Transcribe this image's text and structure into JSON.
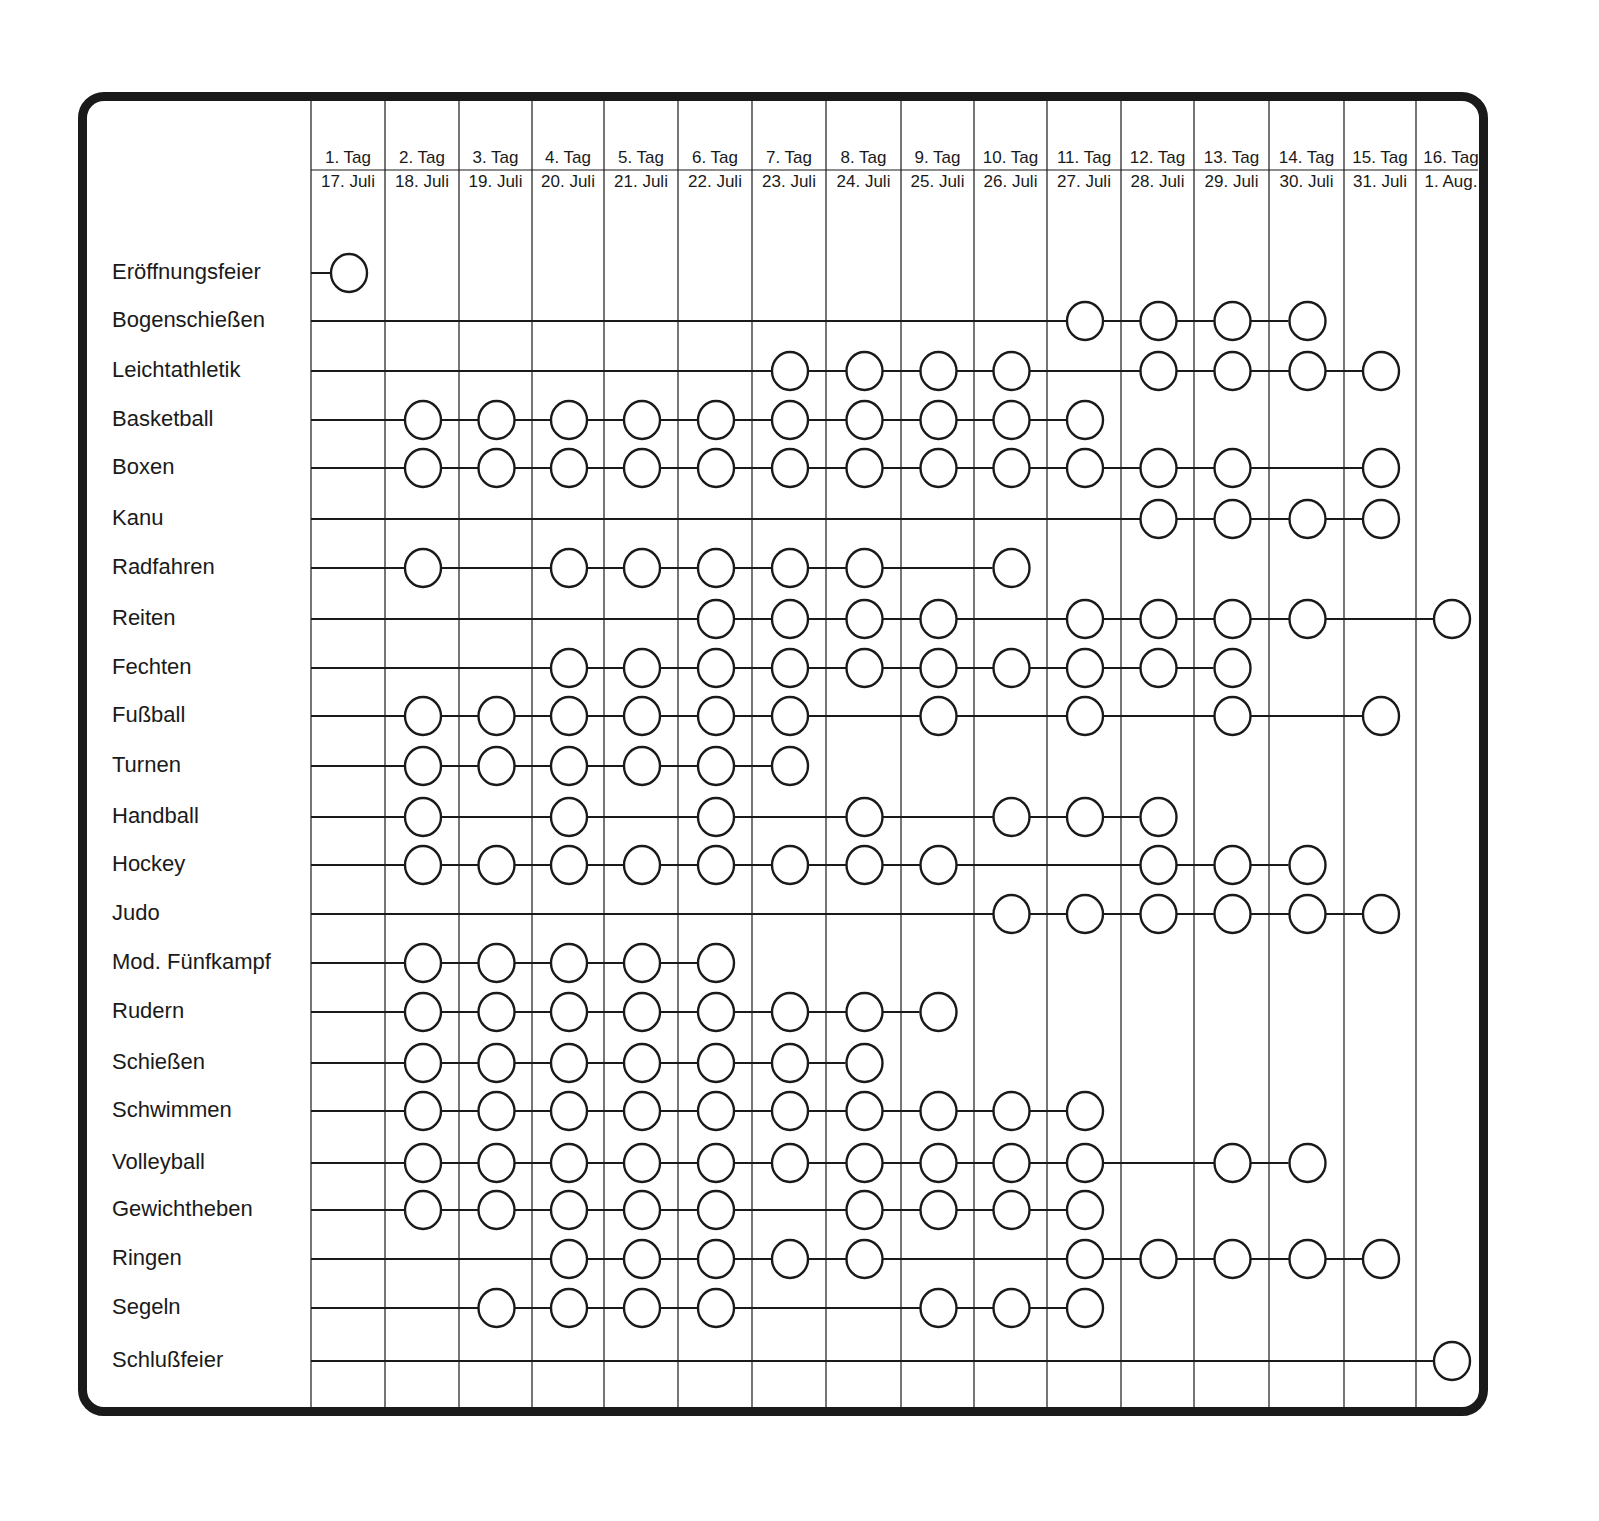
{
  "chart_data": {
    "type": "table",
    "title": "",
    "columns": [
      {
        "day": "1. Tag",
        "date": "17. Juli"
      },
      {
        "day": "2. Tag",
        "date": "18. Juli"
      },
      {
        "day": "3. Tag",
        "date": "19. Juli"
      },
      {
        "day": "4. Tag",
        "date": "20. Juli"
      },
      {
        "day": "5. Tag",
        "date": "21. Juli"
      },
      {
        "day": "6. Tag",
        "date": "22. Juli"
      },
      {
        "day": "7. Tag",
        "date": "23. Juli"
      },
      {
        "day": "8. Tag",
        "date": "24. Juli"
      },
      {
        "day": "9. Tag",
        "date": "25. Juli"
      },
      {
        "day": "10. Tag",
        "date": "26. Juli"
      },
      {
        "day": "11. Tag",
        "date": "27. Juli"
      },
      {
        "day": "12. Tag",
        "date": "28. Juli"
      },
      {
        "day": "13. Tag",
        "date": "29. Juli"
      },
      {
        "day": "14. Tag",
        "date": "30. Juli"
      },
      {
        "day": "15. Tag",
        "date": "31. Juli"
      },
      {
        "day": "16. Tag",
        "date": "1. Aug."
      }
    ],
    "rows": [
      {
        "sport": "Eröffnungsfeier",
        "days": [
          1
        ]
      },
      {
        "sport": "Bogenschießen",
        "days": [
          11,
          12,
          13,
          14
        ]
      },
      {
        "sport": "Leichtathletik",
        "days": [
          7,
          8,
          9,
          10,
          12,
          13,
          14,
          15
        ]
      },
      {
        "sport": "Basketball",
        "days": [
          2,
          3,
          4,
          5,
          6,
          7,
          8,
          9,
          10,
          11
        ]
      },
      {
        "sport": "Boxen",
        "days": [
          2,
          3,
          4,
          5,
          6,
          7,
          8,
          9,
          10,
          11,
          12,
          13,
          15
        ]
      },
      {
        "sport": "Kanu",
        "days": [
          12,
          13,
          14,
          15
        ]
      },
      {
        "sport": "Radfahren",
        "days": [
          2,
          4,
          5,
          6,
          7,
          8,
          10
        ]
      },
      {
        "sport": "Reiten",
        "days": [
          6,
          7,
          8,
          9,
          11,
          12,
          13,
          14,
          16
        ]
      },
      {
        "sport": "Fechten",
        "days": [
          4,
          5,
          6,
          7,
          8,
          9,
          10,
          11,
          12,
          13
        ]
      },
      {
        "sport": "Fußball",
        "days": [
          2,
          3,
          4,
          5,
          6,
          7,
          9,
          11,
          13,
          15
        ]
      },
      {
        "sport": "Turnen",
        "days": [
          2,
          3,
          4,
          5,
          6,
          7
        ]
      },
      {
        "sport": "Handball",
        "days": [
          2,
          4,
          6,
          8,
          10,
          11,
          12
        ]
      },
      {
        "sport": "Hockey",
        "days": [
          2,
          3,
          4,
          5,
          6,
          7,
          8,
          9,
          12,
          13,
          14
        ]
      },
      {
        "sport": "Judo",
        "days": [
          10,
          11,
          12,
          13,
          14,
          15
        ]
      },
      {
        "sport": "Mod. Fünfkampf",
        "days": [
          2,
          3,
          4,
          5,
          6
        ]
      },
      {
        "sport": "Rudern",
        "days": [
          2,
          3,
          4,
          5,
          6,
          7,
          8,
          9
        ]
      },
      {
        "sport": "Schießen",
        "days": [
          2,
          3,
          4,
          5,
          6,
          7,
          8
        ]
      },
      {
        "sport": "Schwimmen",
        "days": [
          2,
          3,
          4,
          5,
          6,
          7,
          8,
          9,
          10,
          11
        ]
      },
      {
        "sport": "Volleyball",
        "days": [
          2,
          3,
          4,
          5,
          6,
          7,
          8,
          9,
          10,
          11,
          13,
          14
        ]
      },
      {
        "sport": "Gewichtheben",
        "days": [
          2,
          3,
          4,
          5,
          6,
          8,
          9,
          10,
          11
        ]
      },
      {
        "sport": "Ringen",
        "days": [
          4,
          5,
          6,
          7,
          8,
          11,
          12,
          13,
          14,
          15
        ]
      },
      {
        "sport": "Segeln",
        "days": [
          3,
          4,
          5,
          6,
          9,
          10,
          11
        ]
      },
      {
        "sport": "Schlußfeier",
        "days": [
          16
        ]
      }
    ],
    "grid": true,
    "legend": null
  },
  "layout": {
    "col_edges": [
      311,
      385,
      459,
      532,
      604,
      678,
      752,
      826,
      901,
      974,
      1047,
      1121,
      1194,
      1269,
      1344,
      1416,
      1486
    ],
    "row_y": [
      273,
      321,
      371,
      420,
      468,
      519,
      568,
      619,
      668,
      716,
      766,
      817,
      865,
      914,
      963,
      1012,
      1063,
      1111,
      1163,
      1210,
      1259,
      1308,
      1361
    ]
  },
  "colors": {
    "ink": "#1a1a1a",
    "background": "#ffffff"
  }
}
